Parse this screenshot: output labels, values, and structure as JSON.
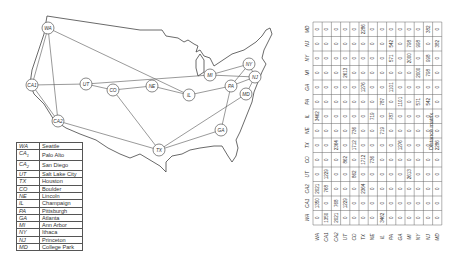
{
  "map": {
    "nodes": [
      {
        "id": "WA",
        "label": "WA",
        "x": 48,
        "y": 28
      },
      {
        "id": "CA1",
        "label": "CA1",
        "x": 32,
        "y": 85
      },
      {
        "id": "CA2",
        "label": "CA2",
        "x": 58,
        "y": 121
      },
      {
        "id": "UT",
        "label": "UT",
        "x": 86,
        "y": 84
      },
      {
        "id": "CO",
        "label": "CO",
        "x": 113,
        "y": 90
      },
      {
        "id": "NE",
        "label": "NE",
        "x": 152,
        "y": 86
      },
      {
        "id": "IL",
        "label": "IL",
        "x": 189,
        "y": 95
      },
      {
        "id": "TX",
        "label": "TX",
        "x": 159,
        "y": 150
      },
      {
        "id": "MI",
        "label": "MI",
        "x": 210,
        "y": 75
      },
      {
        "id": "PA",
        "label": "PA",
        "x": 231,
        "y": 86
      },
      {
        "id": "NY",
        "label": "NY",
        "x": 249,
        "y": 64
      },
      {
        "id": "NJ",
        "label": "NJ",
        "x": 255,
        "y": 77
      },
      {
        "id": "MD",
        "label": "MD",
        "x": 246,
        "y": 94
      },
      {
        "id": "GA",
        "label": "GA",
        "x": 221,
        "y": 130
      }
    ],
    "edges": [
      [
        "WA",
        "CA1"
      ],
      [
        "WA",
        "CA2"
      ],
      [
        "WA",
        "IL"
      ],
      [
        "CA1",
        "CA2"
      ],
      [
        "CA1",
        "UT"
      ],
      [
        "CA2",
        "TX"
      ],
      [
        "UT",
        "CO"
      ],
      [
        "UT",
        "MI"
      ],
      [
        "CO",
        "NE"
      ],
      [
        "CO",
        "TX"
      ],
      [
        "NE",
        "IL"
      ],
      [
        "IL",
        "PA"
      ],
      [
        "TX",
        "GA"
      ],
      [
        "TX",
        "MD"
      ],
      [
        "PA",
        "GA"
      ],
      [
        "PA",
        "NY"
      ],
      [
        "PA",
        "NJ"
      ],
      [
        "MI",
        "NY"
      ],
      [
        "MI",
        "NJ"
      ],
      [
        "NY",
        "NJ"
      ],
      [
        "NJ",
        "MD"
      ]
    ]
  },
  "legend": {
    "rows": [
      {
        "abbr": "WA",
        "sub": "",
        "name": "Seattle"
      },
      {
        "abbr": "CA",
        "sub": "1",
        "name": "Palo Alto"
      },
      {
        "abbr": "CA",
        "sub": "2",
        "name": "San Diego"
      },
      {
        "abbr": "UT",
        "sub": "",
        "name": "Salt Lake City"
      },
      {
        "abbr": "TX",
        "sub": "",
        "name": "Houston"
      },
      {
        "abbr": "CO",
        "sub": "",
        "name": "Boulder"
      },
      {
        "abbr": "NE",
        "sub": "",
        "name": "Lincoln"
      },
      {
        "abbr": "IL",
        "sub": "",
        "name": "Champaign"
      },
      {
        "abbr": "PA",
        "sub": "",
        "name": "Pittsburgh"
      },
      {
        "abbr": "GA",
        "sub": "",
        "name": "Atlanta"
      },
      {
        "abbr": "MI",
        "sub": "",
        "name": "Ann Arbor"
      },
      {
        "abbr": "NY",
        "sub": "",
        "name": "Ithaca"
      },
      {
        "abbr": "NJ",
        "sub": "",
        "name": "Princeton"
      },
      {
        "abbr": "MD",
        "sub": "",
        "name": "College Park"
      }
    ]
  },
  "matrix": {
    "caption": "Distance matrix",
    "labels": [
      "WA",
      "CA1",
      "CA2",
      "UT",
      "CO",
      "TX",
      "NE",
      "IL",
      "PA",
      "GA",
      "MI",
      "NY",
      "NJ",
      "MD"
    ],
    "rows": [
      [
        0,
        1350,
        2021,
        0,
        0,
        0,
        0,
        3462,
        0,
        0,
        0,
        0,
        0,
        0
      ],
      [
        1350,
        0,
        768,
        1229,
        0,
        0,
        0,
        0,
        0,
        0,
        0,
        0,
        0,
        0
      ],
      [
        2021,
        768,
        0,
        0,
        0,
        2364,
        0,
        0,
        0,
        0,
        0,
        0,
        0,
        0
      ],
      [
        0,
        1229,
        0,
        0,
        862,
        0,
        0,
        0,
        0,
        0,
        2613,
        0,
        0,
        0
      ],
      [
        0,
        0,
        0,
        862,
        0,
        1712,
        736,
        0,
        0,
        0,
        0,
        0,
        0,
        0
      ],
      [
        0,
        0,
        2364,
        0,
        1712,
        0,
        0,
        0,
        0,
        1276,
        0,
        0,
        0,
        2286
      ],
      [
        0,
        0,
        0,
        0,
        736,
        0,
        0,
        719,
        0,
        0,
        0,
        0,
        0,
        0
      ],
      [
        3462,
        0,
        0,
        0,
        0,
        0,
        719,
        0,
        787,
        0,
        0,
        0,
        0,
        0
      ],
      [
        0,
        0,
        0,
        0,
        0,
        0,
        0,
        787,
        0,
        1101,
        0,
        571,
        542,
        0
      ],
      [
        0,
        0,
        0,
        0,
        0,
        1276,
        0,
        0,
        1101,
        0,
        0,
        0,
        0,
        0
      ],
      [
        0,
        0,
        0,
        2613,
        0,
        0,
        0,
        0,
        0,
        0,
        0,
        2000,
        798,
        0
      ],
      [
        0,
        0,
        0,
        0,
        0,
        0,
        0,
        0,
        571,
        0,
        2000,
        0,
        998,
        0
      ],
      [
        0,
        0,
        0,
        0,
        0,
        0,
        0,
        0,
        542,
        0,
        798,
        998,
        0,
        382
      ],
      [
        0,
        0,
        0,
        0,
        0,
        2286,
        0,
        0,
        0,
        0,
        0,
        0,
        382,
        0
      ]
    ]
  }
}
